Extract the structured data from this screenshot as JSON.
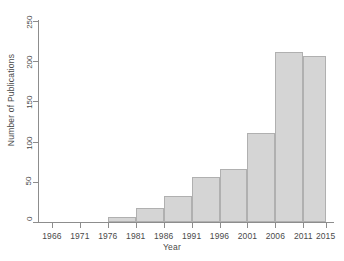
{
  "chart_data": {
    "type": "bar",
    "title": "",
    "subtitle": "",
    "xlabel": "Year",
    "ylabel": "Number of Publications",
    "categories": [
      "1976",
      "1981",
      "1986",
      "1991",
      "1996",
      "2001",
      "2006",
      "2011"
    ],
    "bins": [
      {
        "start": 1976,
        "end": 1981,
        "label": "1976",
        "value": 6
      },
      {
        "start": 1981,
        "end": 1986,
        "label": "1981",
        "value": 18
      },
      {
        "start": 1986,
        "end": 1991,
        "label": "1986",
        "value": 32
      },
      {
        "start": 1991,
        "end": 1996,
        "label": "1991",
        "value": 56
      },
      {
        "start": 1996,
        "end": 2001,
        "label": "1996",
        "value": 66
      },
      {
        "start": 2001,
        "end": 2006,
        "label": "2001",
        "value": 111
      },
      {
        "start": 2006,
        "end": 2011,
        "label": "2006",
        "value": 212
      },
      {
        "start": 2011,
        "end": 2015,
        "label": "2011",
        "value": 206
      }
    ],
    "values": [
      6,
      18,
      32,
      56,
      66,
      111,
      212,
      206
    ],
    "xticks": [
      "1966",
      "1971",
      "1976",
      "1981",
      "1986",
      "1991",
      "1996",
      "2001",
      "2006",
      "2011",
      "2015"
    ],
    "yticks": [
      "0",
      "50",
      "100",
      "150",
      "200",
      "250"
    ],
    "xlim": [
      1963.5,
      2016.5
    ],
    "ylim": [
      0,
      250
    ],
    "grid": false,
    "legend": null,
    "bar_fill_color": "#d5d5d5",
    "bar_border_color": "#b0b0b0",
    "axis_color": "#8d8d8d",
    "text_color": "#4a4a4a",
    "background_color": "#ffffff"
  },
  "axis": {
    "y_title": "Number of Publications",
    "x_title": "Year",
    "y_ticks": [
      {
        "label": "0",
        "value": 0
      },
      {
        "label": "50",
        "value": 50
      },
      {
        "label": "100",
        "value": 100
      },
      {
        "label": "150",
        "value": 150
      },
      {
        "label": "200",
        "value": 200
      },
      {
        "label": "250",
        "value": 250
      }
    ],
    "x_ticks": [
      {
        "label": "1966",
        "value": 1966
      },
      {
        "label": "1971",
        "value": 1971
      },
      {
        "label": "1976",
        "value": 1976
      },
      {
        "label": "1981",
        "value": 1981
      },
      {
        "label": "1986",
        "value": 1986
      },
      {
        "label": "1991",
        "value": 1991
      },
      {
        "label": "1996",
        "value": 1996
      },
      {
        "label": "2001",
        "value": 2001
      },
      {
        "label": "2006",
        "value": 2006
      },
      {
        "label": "2011",
        "value": 2011
      },
      {
        "label": "2015",
        "value": 2015
      }
    ]
  }
}
